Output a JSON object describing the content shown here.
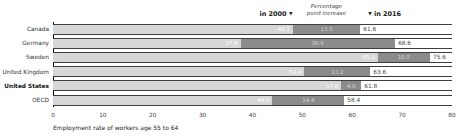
{
  "legend": {
    "in2000_label": "in 2000",
    "increase_line1": "Percentage",
    "increase_line2": "point increase",
    "in2016_label": "in 2016",
    "down_arrow": "▼"
  },
  "chart_data": {
    "type": "bar",
    "orientation": "horizontal",
    "title": "",
    "xlabel": "Employment rate of workers age 55 to 64",
    "ylabel": "",
    "xlim": [
      0,
      80
    ],
    "xticks": [
      0,
      10,
      20,
      30,
      40,
      50,
      60,
      70,
      80
    ],
    "grid": false,
    "legend_position": "top",
    "categories": [
      "Canada",
      "Germany",
      "Sweden",
      "United Kingdom",
      "United States",
      "OECD"
    ],
    "bold_categories": [
      "United States"
    ],
    "series": [
      {
        "name": "in 2000",
        "values": [
          48.1,
          37.6,
          65.1,
          50.4,
          57.8,
          44.0
        ]
      },
      {
        "name": "Percentage point increase",
        "values": [
          13.5,
          30.9,
          10.5,
          13.2,
          4.0,
          14.4
        ]
      },
      {
        "name": "in 2016",
        "values": [
          61.6,
          68.6,
          75.6,
          63.6,
          61.8,
          58.4
        ]
      }
    ],
    "colors": {
      "bar_2000": "#d7d7d7",
      "bar_increase": "#8b8b8b",
      "bar_border": "#3d3d3d",
      "end_label": "#4a4a4a"
    }
  }
}
